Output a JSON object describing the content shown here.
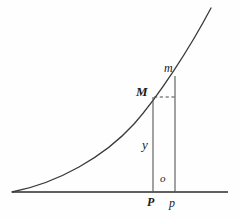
{
  "figure": {
    "kind": "geometry-diagram",
    "colors": {
      "background": "#fefefe",
      "stroke": "#333333",
      "curve": "#3a3a3a",
      "axis": "#2b2b2b",
      "dashed": "#4a4a4a",
      "label": "#1a1a1a"
    },
    "labels": {
      "curve_point_M": "M",
      "curve_point_m": "m",
      "ordinate_y": "y",
      "increment_o": "o",
      "foot_P": "P",
      "foot_p": "p"
    },
    "geometry": {
      "baseline": {
        "x1": 12,
        "y1": 192,
        "x2": 228,
        "y2": 192
      },
      "ordinate_PM": {
        "x": 153,
        "y_top": 97,
        "y_bottom": 192
      },
      "ordinate_pm": {
        "x": 175,
        "y_top": 76,
        "y_bottom": 192
      },
      "dashed_horizontal": {
        "x1": 153,
        "y1": 97,
        "x2": 175,
        "y2": 97
      },
      "curve_start": {
        "x": 12,
        "y": 192
      },
      "curve_end": {
        "x": 211,
        "y": 8
      },
      "curve_path": "M 12,192 C 60,182 110,152 140,116 C 160,92 190,46 211,8"
    }
  }
}
